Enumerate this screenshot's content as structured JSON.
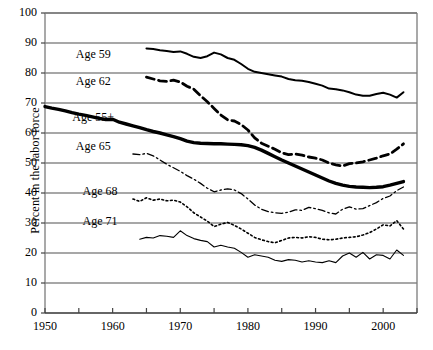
{
  "chart_data": {
    "type": "line",
    "title": "",
    "xlabel": "",
    "ylabel": "Percent in the labor force",
    "xlim": [
      1950,
      2005
    ],
    "ylim": [
      0,
      100
    ],
    "grid": true,
    "legend_position": "inline-labels",
    "yticks": [
      0,
      10,
      20,
      30,
      40,
      50,
      60,
      70,
      80,
      90,
      100
    ],
    "xticks": [
      1950,
      1955,
      1960,
      1965,
      1970,
      1975,
      1980,
      1985,
      1990,
      1995,
      2000,
      2005
    ],
    "xticklabels": [
      "1950",
      "",
      "1960",
      "",
      "1970",
      "",
      "1980",
      "",
      "1990",
      "",
      "2000",
      ""
    ],
    "series": [
      {
        "name": "Age 55+",
        "label": "Age 55+",
        "style": "solid-thick",
        "color": "#000000",
        "width": 3.4,
        "x": [
          1950,
          1951,
          1952,
          1953,
          1954,
          1955,
          1956,
          1957,
          1958,
          1959,
          1960,
          1961,
          1962,
          1963,
          1964,
          1965,
          1966,
          1967,
          1968,
          1969,
          1970,
          1971,
          1972,
          1973,
          1974,
          1975,
          1976,
          1977,
          1978,
          1979,
          1980,
          1981,
          1982,
          1983,
          1984,
          1985,
          1986,
          1987,
          1988,
          1989,
          1990,
          1991,
          1992,
          1993,
          1994,
          1995,
          1996,
          1997,
          1998,
          1999,
          2000,
          2001,
          2002,
          2003
        ],
        "y": [
          68.8,
          68.3,
          67.9,
          67.4,
          66.8,
          66.3,
          65.9,
          65.4,
          64.9,
          64.5,
          64.6,
          63.6,
          63.0,
          62.4,
          61.8,
          61.1,
          60.5,
          60.0,
          59.4,
          58.8,
          58.1,
          57.3,
          56.8,
          56.6,
          56.5,
          56.4,
          56.4,
          56.3,
          56.2,
          56.1,
          55.8,
          55.2,
          54.3,
          53.2,
          52.1,
          51.0,
          50.0,
          49.0,
          48.0,
          47.0,
          46.0,
          45.0,
          44.0,
          43.2,
          42.6,
          42.2,
          42.0,
          41.9,
          41.8,
          41.9,
          42.1,
          42.6,
          43.2,
          43.8
        ]
      },
      {
        "name": "Age 59",
        "label": "Age 59",
        "style": "solid-medium",
        "color": "#000000",
        "width": 2.0,
        "x": [
          1965,
          1966,
          1967,
          1968,
          1969,
          1970,
          1971,
          1972,
          1973,
          1974,
          1975,
          1976,
          1977,
          1978,
          1979,
          1980,
          1981,
          1982,
          1983,
          1984,
          1985,
          1986,
          1987,
          1988,
          1989,
          1990,
          1991,
          1992,
          1993,
          1994,
          1995,
          1996,
          1997,
          1998,
          1999,
          2000,
          2001,
          2002,
          2003
        ],
        "y": [
          88.2,
          88.0,
          87.6,
          87.3,
          87.0,
          87.2,
          86.4,
          85.4,
          85.0,
          85.6,
          86.8,
          86.2,
          85.0,
          84.4,
          83.0,
          81.4,
          80.4,
          80.0,
          79.6,
          79.2,
          78.8,
          78.0,
          77.6,
          77.4,
          77.0,
          76.4,
          75.8,
          74.8,
          74.6,
          74.2,
          73.6,
          72.8,
          72.4,
          72.4,
          73.0,
          73.4,
          72.8,
          71.8,
          73.6
        ]
      },
      {
        "name": "Age 62",
        "label": "Age 62",
        "style": "dashed",
        "color": "#000000",
        "width": 2.8,
        "x": [
          1965,
          1966,
          1967,
          1968,
          1969,
          1970,
          1971,
          1972,
          1973,
          1974,
          1975,
          1976,
          1977,
          1978,
          1979,
          1980,
          1981,
          1982,
          1983,
          1984,
          1985,
          1986,
          1987,
          1988,
          1989,
          1990,
          1991,
          1992,
          1993,
          1994,
          1995,
          1996,
          1997,
          1998,
          1999,
          2000,
          2001,
          2002,
          2003
        ],
        "y": [
          78.6,
          78.0,
          77.4,
          77.2,
          77.6,
          77.0,
          75.6,
          74.6,
          72.4,
          70.4,
          68.2,
          66.0,
          64.4,
          64.0,
          62.8,
          61.0,
          58.4,
          56.6,
          55.6,
          54.6,
          53.4,
          52.8,
          53.0,
          52.6,
          52.0,
          51.6,
          51.0,
          50.0,
          49.4,
          49.0,
          49.8,
          50.0,
          50.4,
          51.0,
          51.6,
          52.4,
          53.0,
          54.6,
          56.4
        ]
      },
      {
        "name": "Age 65",
        "label": "Age 65",
        "style": "dash-dot",
        "color": "#000000",
        "width": 1.3,
        "x": [
          1963,
          1964,
          1965,
          1966,
          1967,
          1968,
          1969,
          1970,
          1971,
          1972,
          1973,
          1974,
          1975,
          1976,
          1977,
          1978,
          1979,
          1980,
          1981,
          1982,
          1983,
          1984,
          1985,
          1986,
          1987,
          1988,
          1989,
          1990,
          1991,
          1992,
          1993,
          1994,
          1995,
          1996,
          1997,
          1998,
          1999,
          2000,
          2001,
          2002,
          2003
        ],
        "y": [
          53.0,
          52.8,
          53.2,
          52.4,
          51.0,
          49.6,
          48.4,
          47.2,
          45.8,
          44.6,
          43.2,
          41.6,
          40.4,
          41.0,
          41.4,
          41.0,
          39.8,
          38.0,
          36.0,
          34.6,
          33.8,
          33.4,
          33.2,
          33.6,
          34.4,
          34.2,
          35.2,
          34.8,
          34.2,
          33.4,
          33.0,
          34.6,
          35.4,
          34.6,
          34.8,
          35.8,
          36.8,
          38.2,
          39.0,
          40.8,
          42.0
        ]
      },
      {
        "name": "Age 68",
        "label": "Age 68",
        "style": "dotted",
        "color": "#000000",
        "width": 1.6,
        "x": [
          1963,
          1964,
          1965,
          1966,
          1967,
          1968,
          1969,
          1970,
          1971,
          1972,
          1973,
          1974,
          1975,
          1976,
          1977,
          1978,
          1979,
          1980,
          1981,
          1982,
          1983,
          1984,
          1985,
          1986,
          1987,
          1988,
          1989,
          1990,
          1991,
          1992,
          1993,
          1994,
          1995,
          1996,
          1997,
          1998,
          1999,
          2000,
          2001,
          2002,
          2003
        ],
        "y": [
          38.0,
          37.2,
          38.4,
          37.6,
          38.0,
          37.4,
          37.6,
          37.0,
          35.4,
          33.4,
          32.0,
          30.6,
          28.8,
          29.6,
          30.2,
          29.2,
          28.0,
          26.6,
          25.2,
          24.4,
          23.8,
          23.4,
          24.2,
          25.0,
          25.2,
          25.0,
          25.4,
          25.2,
          24.6,
          24.4,
          24.6,
          25.0,
          25.2,
          25.4,
          26.0,
          26.8,
          28.0,
          29.4,
          29.0,
          30.8,
          28.0
        ]
      },
      {
        "name": "Age 71",
        "label": "Age 71",
        "style": "solid-thin",
        "color": "#000000",
        "width": 1.1,
        "x": [
          1964,
          1965,
          1966,
          1967,
          1968,
          1969,
          1970,
          1971,
          1972,
          1973,
          1974,
          1975,
          1976,
          1977,
          1978,
          1979,
          1980,
          1981,
          1982,
          1983,
          1984,
          1985,
          1986,
          1987,
          1988,
          1989,
          1990,
          1991,
          1992,
          1993,
          1994,
          1995,
          1996,
          1997,
          1998,
          1999,
          2000,
          2001,
          2002,
          2003
        ],
        "y": [
          24.6,
          25.2,
          25.0,
          25.8,
          25.6,
          25.2,
          27.4,
          25.8,
          24.8,
          24.2,
          23.8,
          22.0,
          22.6,
          22.0,
          21.6,
          20.2,
          18.6,
          19.4,
          19.0,
          18.6,
          17.6,
          17.2,
          17.8,
          17.6,
          17.0,
          17.4,
          17.0,
          16.8,
          17.4,
          16.8,
          19.0,
          20.0,
          18.6,
          20.2,
          18.0,
          19.4,
          19.2,
          18.0,
          21.0,
          19.2
        ]
      }
    ],
    "annotations": [
      {
        "text": "Age 59",
        "x": 1957.5,
        "y": 86.0
      },
      {
        "text": "Age 62",
        "x": 1957.5,
        "y": 77.0
      },
      {
        "text": "Age 55+",
        "x": 1957.0,
        "y": 65.0
      },
      {
        "text": "Age 65",
        "x": 1957.5,
        "y": 55.5
      },
      {
        "text": "Age 68",
        "x": 1958.5,
        "y": 40.5
      },
      {
        "text": "Age 71",
        "x": 1958.5,
        "y": 30.5
      }
    ]
  },
  "colors": {
    "grid": "#8a8a8a",
    "axis": "#7b7b7b",
    "line": "#000000",
    "background": "#ffffff"
  }
}
